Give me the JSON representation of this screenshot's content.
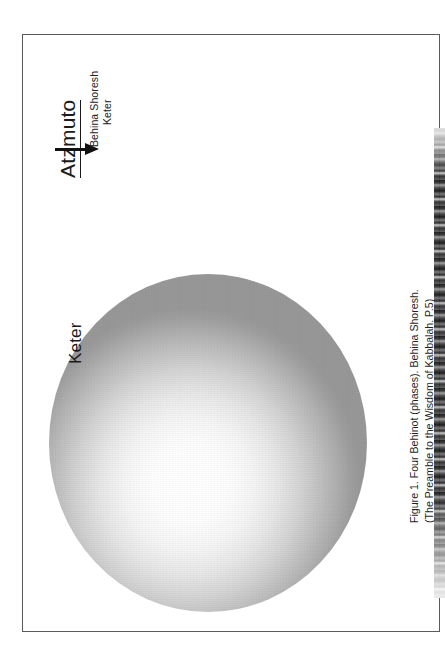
{
  "document": {
    "type": "scanned-book-page",
    "orientation": "rotated-90-ccw"
  },
  "diagram": {
    "heading": "Atzmuto",
    "arrow_labels": {
      "line1": "Behina Shoresh",
      "line2": "Keter"
    },
    "sphere_label": "Keter",
    "arrow_icon": "arrow-right-icon"
  },
  "caption": {
    "line1": "Figure 1. Four Behinot (phases). Behina Shoresh.",
    "line2": "(The Preamble to the Wisdom of Kabbalah. P.5)"
  },
  "colors": {
    "page_background": "#ffffff",
    "frame_border": "#5a5a5a",
    "text": "#1a1a1a",
    "arrow": "#111111",
    "sphere_center": "#ffffff",
    "sphere_edge": "#989898",
    "scan_edge": "#111111"
  }
}
